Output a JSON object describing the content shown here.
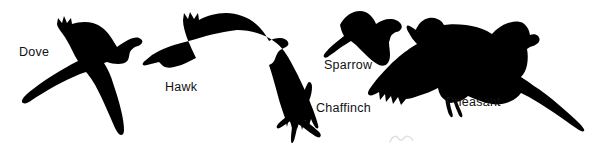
{
  "figure": {
    "kind": "bird-silhouette-identification-chart",
    "background_color": "#ffffff",
    "silhouette_color": "#000000",
    "width": 601,
    "height": 152
  },
  "birds": [
    {
      "id": "dove",
      "label": "Dove",
      "label_color": "#111111",
      "pose": "flying, viewed from below, wings spread in X shape, head upper right"
    },
    {
      "id": "hawk",
      "label": "Hawk",
      "label_color": "#111111",
      "pose": "flying, side/below view, long tail to the left, fingered primaries"
    },
    {
      "id": "sparrow",
      "label": "Sparrow",
      "label_color": "#111111",
      "pose": "flying, compact body, short tail to lower left"
    },
    {
      "id": "chaffinch",
      "label": "Chaffinch",
      "label_color": "#111111",
      "pose": "flying, small, swept-back wings, notched tail"
    },
    {
      "id": "pheasant",
      "label": "Pheasant",
      "label_color": "#111111",
      "pose": "flying, heavy body, very long pointed tail to the right"
    }
  ],
  "marks": {
    "faint_scribble": {
      "description": "small faint pencil-like mark near bottom centre",
      "opacity": 0.3
    }
  }
}
